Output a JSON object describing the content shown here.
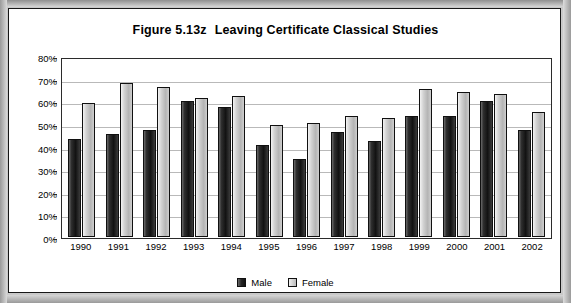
{
  "figure": {
    "title_prefix": "Figure 5.13z",
    "title_text": "Leaving Certificate Classical Studies"
  },
  "legend": {
    "male_label": "Male",
    "female_label": "Female",
    "male_color": "#1c1c1c",
    "female_color": "#d0d0d0"
  },
  "axis": {
    "y_ticks": [
      "80%",
      "70%",
      "60%",
      "50%",
      "40%",
      "30%",
      "20%",
      "10%",
      "0%"
    ]
  },
  "chart_data": {
    "type": "bar",
    "xlabel": "",
    "ylabel": "",
    "ylim": [
      0,
      80
    ],
    "ytick_step": 10,
    "ytick_format": "percent",
    "grid": true,
    "legend_position": "bottom",
    "categories": [
      "1990",
      "1991",
      "1992",
      "1993",
      "1994",
      "1995",
      "1996",
      "1997",
      "1998",
      "1999",
      "2000",
      "2001",
      "2002"
    ],
    "series": [
      {
        "name": "Male",
        "color": "#1c1c1c",
        "values": [
          44,
          46,
          48,
          61,
          58,
          41,
          35,
          47,
          43,
          54,
          54,
          61,
          48
        ]
      },
      {
        "name": "Female",
        "color": "#d0d0d0",
        "values": [
          60,
          69,
          67,
          62,
          63,
          50,
          51,
          54,
          53,
          66,
          65,
          64,
          56
        ]
      }
    ]
  }
}
